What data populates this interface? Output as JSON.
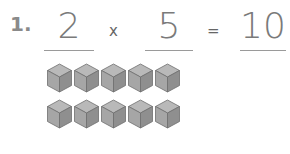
{
  "problem": {
    "number": "1.",
    "factor1": "2",
    "operator": "x",
    "factor2": "5",
    "equals": "=",
    "product": "10"
  },
  "cube_groups": {
    "rows": 2,
    "cubes_per_row": 5,
    "cube_icon": "cube-icon",
    "colors": {
      "top": "#b9b9b9",
      "left": "#a6a6a6",
      "right": "#8f8f8f",
      "edge": "#6e6e6e"
    }
  }
}
